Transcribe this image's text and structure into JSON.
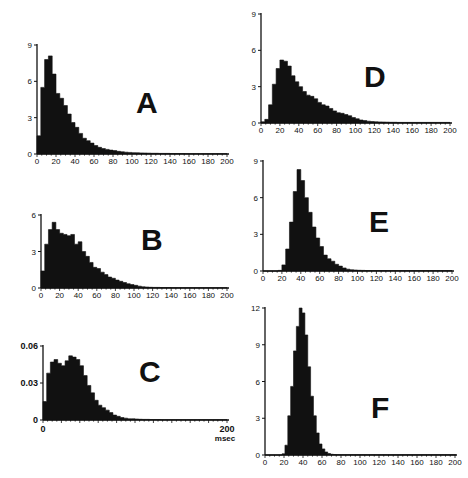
{
  "chart_data": [
    {
      "id": "A",
      "type": "bar",
      "panel_label": "A",
      "xlabel": "",
      "ylabel": "",
      "xlim": [
        0,
        200
      ],
      "ylim": [
        0,
        9
      ],
      "xticks": [
        0,
        20,
        40,
        60,
        80,
        100,
        120,
        140,
        160,
        180,
        200
      ],
      "yticks": [
        0,
        3,
        6,
        9
      ],
      "bin_width": 4,
      "x": [
        0,
        4,
        8,
        12,
        16,
        20,
        24,
        28,
        32,
        36,
        40,
        44,
        48,
        52,
        56,
        60,
        64,
        68,
        72,
        76,
        80,
        84,
        88,
        92,
        96,
        100,
        104,
        108,
        112,
        116,
        120,
        124,
        128,
        132,
        136,
        140,
        144,
        148,
        152,
        156,
        160,
        164,
        168,
        172,
        176,
        180,
        184,
        188,
        192,
        196
      ],
      "values": [
        1.5,
        5.5,
        7.8,
        8.1,
        6.6,
        5.0,
        4.6,
        4.0,
        3.3,
        2.6,
        2.2,
        1.7,
        1.3,
        1.1,
        0.9,
        0.7,
        0.55,
        0.45,
        0.38,
        0.32,
        0.28,
        0.22,
        0.18,
        0.15,
        0.13,
        0.11,
        0.1,
        0.09,
        0.08,
        0.07,
        0.06,
        0.06,
        0.05,
        0.05,
        0.05,
        0.04,
        0.04,
        0.04,
        0.04,
        0.03,
        0.03,
        0.03,
        0.03,
        0.03,
        0.03,
        0.03,
        0.03,
        0.03,
        0.03,
        0.03
      ],
      "axis_px": {
        "x0": 37,
        "x1": 227,
        "y0": 154,
        "y1": 45
      },
      "label_px": {
        "x": 136,
        "y": 113
      }
    },
    {
      "id": "B",
      "type": "bar",
      "panel_label": "B",
      "xlabel": "",
      "ylabel": "",
      "xlim": [
        0,
        200
      ],
      "ylim": [
        0,
        6
      ],
      "xticks": [
        0,
        20,
        40,
        60,
        80,
        100,
        120,
        140,
        160,
        180,
        200
      ],
      "yticks": [
        0,
        3,
        6
      ],
      "bin_width": 4,
      "x": [
        0,
        4,
        8,
        12,
        16,
        20,
        24,
        28,
        32,
        36,
        40,
        44,
        48,
        52,
        56,
        60,
        64,
        68,
        72,
        76,
        80,
        84,
        88,
        92,
        96,
        100,
        104,
        108,
        112,
        116,
        120,
        124,
        128,
        132,
        136,
        140,
        144,
        148,
        152,
        156,
        160,
        164,
        168,
        172,
        176,
        180,
        184,
        188,
        192,
        196
      ],
      "values": [
        1.4,
        3.6,
        4.8,
        5.4,
        4.8,
        4.5,
        4.4,
        4.3,
        4.4,
        3.6,
        3.8,
        3.0,
        2.6,
        2.1,
        1.7,
        1.6,
        1.3,
        1.1,
        0.9,
        0.8,
        0.65,
        0.55,
        0.45,
        0.35,
        0.28,
        0.22,
        0.15,
        0.1,
        0.08,
        0.06,
        0.05,
        0.05,
        0.04,
        0.04,
        0.04,
        0.03,
        0.03,
        0.03,
        0.03,
        0.03,
        0.03,
        0.03,
        0.03,
        0.03,
        0.03,
        0.03,
        0.03,
        0.03,
        0.03,
        0.03
      ],
      "axis_px": {
        "x0": 41,
        "x1": 227,
        "y0": 288,
        "y1": 215
      },
      "label_px": {
        "x": 141,
        "y": 250
      }
    },
    {
      "id": "C",
      "type": "bar",
      "panel_label": "C",
      "xlabel": "msec",
      "ylabel": "",
      "xlim": [
        0,
        200
      ],
      "ylim": [
        0,
        0.06
      ],
      "xticks": [
        0,
        200
      ],
      "yticks": [
        0,
        0.03,
        0.06
      ],
      "ytick_labels": [
        "0",
        "0.03",
        "0.06"
      ],
      "bin_width": 4,
      "x": [
        0,
        4,
        8,
        12,
        16,
        20,
        24,
        28,
        32,
        36,
        40,
        44,
        48,
        52,
        56,
        60,
        64,
        68,
        72,
        76,
        80,
        84,
        88,
        92,
        96,
        100,
        104,
        108,
        112,
        116,
        120,
        124,
        128,
        132,
        136,
        140,
        144,
        148,
        152,
        156,
        160,
        164,
        168,
        172,
        176,
        180,
        184,
        188,
        192,
        196
      ],
      "values": [
        0.015,
        0.038,
        0.047,
        0.049,
        0.046,
        0.044,
        0.048,
        0.052,
        0.051,
        0.049,
        0.044,
        0.036,
        0.028,
        0.022,
        0.016,
        0.012,
        0.01,
        0.008,
        0.006,
        0.004,
        0.003,
        0.002,
        0.0015,
        0.001,
        0.001,
        0.0008,
        0.0006,
        0.0005,
        0.0005,
        0.0004,
        0.0004,
        0.0004,
        0.0003,
        0.0003,
        0.0003,
        0.0003,
        0.0003,
        0.0003,
        0.0003,
        0.0003,
        0.0003,
        0.0003,
        0.0003,
        0.0003,
        0.0003,
        0.0003,
        0.0003,
        0.0003,
        0.0003,
        0.0003
      ],
      "axis_px": {
        "x0": 43,
        "x1": 227,
        "y0": 420,
        "y1": 346
      },
      "label_px": {
        "x": 139,
        "y": 382
      }
    },
    {
      "id": "D",
      "type": "bar",
      "panel_label": "D",
      "xlabel": "",
      "ylabel": "",
      "xlim": [
        0,
        200
      ],
      "ylim": [
        0,
        9
      ],
      "xticks": [
        0,
        20,
        40,
        60,
        80,
        100,
        120,
        140,
        160,
        180,
        200
      ],
      "yticks": [
        0,
        3,
        6,
        9
      ],
      "bin_width": 4,
      "x": [
        0,
        4,
        8,
        12,
        16,
        20,
        24,
        28,
        32,
        36,
        40,
        44,
        48,
        52,
        56,
        60,
        64,
        68,
        72,
        76,
        80,
        84,
        88,
        92,
        96,
        100,
        104,
        108,
        112,
        116,
        120,
        124,
        128,
        132,
        136,
        140,
        144,
        148,
        152,
        156,
        160,
        164,
        168,
        172,
        176,
        180,
        184,
        188,
        192,
        196
      ],
      "values": [
        0.1,
        0.3,
        1.5,
        3.2,
        4.5,
        5.2,
        5.1,
        4.7,
        3.9,
        3.4,
        3.0,
        2.6,
        2.3,
        2.2,
        2.0,
        1.7,
        1.5,
        1.4,
        1.2,
        1.0,
        0.85,
        0.8,
        0.7,
        0.6,
        0.45,
        0.35,
        0.25,
        0.2,
        0.15,
        0.12,
        0.1,
        0.09,
        0.08,
        0.07,
        0.06,
        0.06,
        0.05,
        0.05,
        0.05,
        0.05,
        0.05,
        0.05,
        0.05,
        0.05,
        0.05,
        0.05,
        0.05,
        0.05,
        0.05,
        0.05
      ],
      "axis_px": {
        "x0": 261,
        "x1": 450,
        "y0": 123,
        "y1": 14
      },
      "label_px": {
        "x": 364,
        "y": 87
      }
    },
    {
      "id": "E",
      "type": "bar",
      "panel_label": "E",
      "xlabel": "",
      "ylabel": "",
      "xlim": [
        0,
        200
      ],
      "ylim": [
        0,
        9
      ],
      "xticks": [
        0,
        20,
        40,
        60,
        80,
        100,
        120,
        140,
        160,
        180,
        200
      ],
      "yticks": [
        0,
        3,
        6,
        9
      ],
      "bin_width": 4,
      "x": [
        0,
        4,
        8,
        12,
        16,
        20,
        24,
        28,
        32,
        36,
        40,
        44,
        48,
        52,
        56,
        60,
        64,
        68,
        72,
        76,
        80,
        84,
        88,
        92,
        96,
        100,
        104,
        108,
        112,
        116,
        120,
        124,
        128,
        132,
        136,
        140,
        144,
        148,
        152,
        156,
        160,
        164,
        168,
        172,
        176,
        180,
        184,
        188,
        192,
        196
      ],
      "values": [
        0,
        0,
        0,
        0,
        0.05,
        0.5,
        1.8,
        4.0,
        6.5,
        8.3,
        7.4,
        6.0,
        4.8,
        3.6,
        2.7,
        2.0,
        1.3,
        1.0,
        0.8,
        0.55,
        0.4,
        0.25,
        0.15,
        0.1,
        0.08,
        0.06,
        0.05,
        0.04,
        0.04,
        0.04,
        0.04,
        0.04,
        0.04,
        0.04,
        0.04,
        0.04,
        0.04,
        0.04,
        0.04,
        0.04,
        0.04,
        0.04,
        0.04,
        0.04,
        0.04,
        0.04,
        0.04,
        0.04,
        0.04,
        0.04
      ],
      "axis_px": {
        "x0": 263,
        "x1": 452,
        "y0": 271,
        "y1": 161
      },
      "label_px": {
        "x": 369,
        "y": 232
      }
    },
    {
      "id": "F",
      "type": "bar",
      "panel_label": "F",
      "xlabel": "",
      "ylabel": "",
      "xlim": [
        0,
        200
      ],
      "ylim": [
        0,
        12
      ],
      "xticks": [
        0,
        20,
        40,
        60,
        80,
        100,
        120,
        140,
        160,
        180,
        200
      ],
      "yticks": [
        0,
        3,
        6,
        9,
        12
      ],
      "bin_width": 3,
      "x": [
        0,
        3,
        6,
        9,
        12,
        15,
        18,
        21,
        24,
        27,
        30,
        33,
        36,
        39,
        42,
        45,
        48,
        51,
        54,
        57,
        60,
        63,
        66,
        69,
        72,
        75,
        78,
        81,
        84,
        87,
        90,
        93,
        96,
        99,
        102,
        105,
        108,
        111,
        114,
        117,
        120,
        123,
        126,
        129,
        132,
        135,
        138,
        141,
        144,
        147,
        150,
        153,
        156,
        159,
        162,
        165,
        168,
        171,
        174,
        177,
        180,
        183,
        186,
        189,
        192,
        195,
        198
      ],
      "values": [
        0,
        0,
        0,
        0,
        0,
        0,
        0.1,
        0.8,
        3.2,
        5.6,
        8.5,
        10.5,
        12.0,
        11.6,
        9.8,
        7.2,
        4.8,
        3.2,
        1.8,
        0.9,
        0.5,
        0.25,
        0.12,
        0.06,
        0.04,
        0.03,
        0.02,
        0.02,
        0.02,
        0.02,
        0.02,
        0.02,
        0.02,
        0.02,
        0.02,
        0.02,
        0.02,
        0.02,
        0.02,
        0.02,
        0.02,
        0.02,
        0.02,
        0.02,
        0.02,
        0.02,
        0.02,
        0.02,
        0.02,
        0.02,
        0.02,
        0.02,
        0.02,
        0.02,
        0.02,
        0.02,
        0.02,
        0.02,
        0.02,
        0.02,
        0.02,
        0.02,
        0.02,
        0.02,
        0.02,
        0.02,
        0.02
      ],
      "axis_px": {
        "x0": 265,
        "x1": 455,
        "y0": 455,
        "y1": 308
      },
      "label_px": {
        "x": 371,
        "y": 418
      }
    }
  ],
  "figure": {
    "panels": [
      "A",
      "B",
      "C",
      "D",
      "E",
      "F"
    ],
    "background": "#ffffff",
    "bar_color": "#111111",
    "axis_color": "#111111"
  }
}
